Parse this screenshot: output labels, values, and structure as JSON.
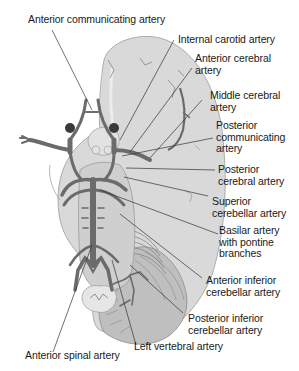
{
  "diagram": {
    "type": "anatomical-illustration",
    "colors": {
      "background": "#ffffff",
      "brain_fill": "#d9d9d9",
      "cerebellum_fill": "#bfbfbf",
      "artery": "#6b6b6b",
      "leader_line": "#333333",
      "text": "#1a1a1a"
    },
    "labels": {
      "anterior_communicating": "Anterior communicating artery",
      "internal_carotid": "Internal carotid artery",
      "anterior_cerebral_1": "Anterior cerebral",
      "anterior_cerebral_2": "artery",
      "middle_cerebral_1": "Middle cerebral",
      "middle_cerebral_2": "artery",
      "posterior_communicating_1": "Posterior",
      "posterior_communicating_2": "communicating",
      "posterior_communicating_3": "artery",
      "posterior_cerebral_1": "Posterior",
      "posterior_cerebral_2": "cerebral artery",
      "superior_cerebellar_1": "Superior",
      "superior_cerebellar_2": "cerebellar artery",
      "basilar_1": "Basilar artery",
      "basilar_2": "with pontine",
      "basilar_3": "branches",
      "aica_1": "Anterior inferior",
      "aica_2": "cerebellar artery",
      "pica_1": "Posterior inferior",
      "pica_2": "cerebellar artery",
      "anterior_spinal": "Anterior spinal artery",
      "left_vertebral": "Left vertebral artery"
    }
  }
}
